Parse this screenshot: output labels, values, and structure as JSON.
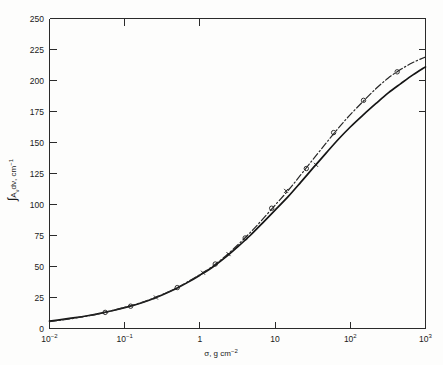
{
  "figure": {
    "background_color": "#fdfdfc",
    "ink_color": "#1a1a1a"
  },
  "axes": {
    "x_label_prefix": "σ, g cm",
    "x_label_exponent": "−2",
    "y_label_integral": "∫",
    "y_label_main": "A",
    "y_label_sub": "ν",
    "y_label_mid": "dν, cm",
    "y_label_exponent": "−1",
    "x_tick_labels": [
      {
        "mantissa": "10",
        "exponent": "−2",
        "value": 0.01
      },
      {
        "mantissa": "10",
        "exponent": "−1",
        "value": 0.1
      },
      {
        "mantissa": "1",
        "exponent": "",
        "value": 1
      },
      {
        "mantissa": "10",
        "exponent": "",
        "value": 10
      },
      {
        "mantissa": "10",
        "exponent": "2",
        "value": 100
      },
      {
        "mantissa": "10",
        "exponent": "3",
        "value": 1000
      }
    ],
    "y_tick_labels": [
      "250",
      "225",
      "200",
      "175",
      "150",
      "125",
      "100",
      "75",
      "50",
      "25",
      "0"
    ]
  },
  "chart_data": {
    "type": "line",
    "title": "",
    "xlabel": "σ, g cm⁻²",
    "ylabel": "∫Aν dν, cm⁻¹",
    "xscale": "log",
    "yscale": "linear",
    "xlim": [
      0.01,
      1000
    ],
    "ylim": [
      0,
      250
    ],
    "ytick_step": 25,
    "grid": false,
    "legend": "none",
    "series": [
      {
        "name": "solid-curve",
        "style": "solid",
        "marker": "x",
        "x": [
          0.01,
          0.015,
          0.022,
          0.032,
          0.047,
          0.068,
          0.1,
          0.15,
          0.22,
          0.32,
          0.47,
          0.68,
          1.0,
          1.5,
          2.2,
          3.2,
          4.7,
          6.8,
          10,
          15,
          22,
          32,
          47,
          68,
          100,
          150,
          220,
          320,
          470,
          680,
          1000
        ],
        "y": [
          6.0,
          7.3,
          8.7,
          10.3,
          12.2,
          14.3,
          16.8,
          19.8,
          23.2,
          27.2,
          31.8,
          37.0,
          43.0,
          49.8,
          57.5,
          66.0,
          75.2,
          85.0,
          95.5,
          106.5,
          118.0,
          129.5,
          141.0,
          152.0,
          162.5,
          172.5,
          181.5,
          190.0,
          197.5,
          204.5,
          211.0
        ]
      },
      {
        "name": "dash-dot-curve",
        "style": "dash-dot",
        "marker": "circle",
        "x": [
          0.01,
          0.015,
          0.022,
          0.032,
          0.047,
          0.068,
          0.1,
          0.15,
          0.22,
          0.32,
          0.47,
          0.68,
          1.0,
          1.5,
          2.2,
          3.2,
          4.7,
          6.8,
          10,
          15,
          22,
          32,
          47,
          68,
          100,
          150,
          220,
          320,
          470,
          680,
          1000
        ],
        "y": [
          5.5,
          6.9,
          8.4,
          10.1,
          12.1,
          14.4,
          17.0,
          20.0,
          23.5,
          27.5,
          32.2,
          37.5,
          43.5,
          50.5,
          58.5,
          67.5,
          77.5,
          88.0,
          99.5,
          111.5,
          124.0,
          136.5,
          149.0,
          161.0,
          172.5,
          183.5,
          193.5,
          202.0,
          209.0,
          214.5,
          219.0
        ]
      }
    ],
    "data_points_x_marker": [
      {
        "x": 0.26,
        "y": 25.0
      },
      {
        "x": 1.1,
        "y": 45.0
      },
      {
        "x": 2.4,
        "y": 60.0
      },
      {
        "x": 14.0,
        "y": 111.0
      },
      {
        "x": 35.0,
        "y": 132.0
      }
    ],
    "data_points_circle_marker": [
      {
        "x": 0.055,
        "y": 13.0
      },
      {
        "x": 0.12,
        "y": 18.0
      },
      {
        "x": 0.5,
        "y": 33.0
      },
      {
        "x": 1.6,
        "y": 52.0
      },
      {
        "x": 4.0,
        "y": 73.0
      },
      {
        "x": 9.0,
        "y": 97.0
      },
      {
        "x": 26.0,
        "y": 129.0
      },
      {
        "x": 60.0,
        "y": 158.0
      },
      {
        "x": 150.0,
        "y": 184.0
      },
      {
        "x": 420.0,
        "y": 207.0
      }
    ]
  }
}
